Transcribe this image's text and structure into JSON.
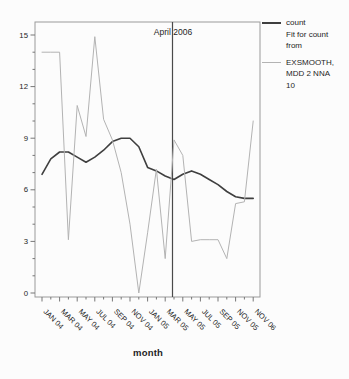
{
  "figure": {
    "xlabel": "month",
    "ref_line_label": "April 2006"
  },
  "legend": {
    "rows": [
      {
        "text": "count",
        "swatch": "#3f3f3f",
        "swatch_thickness": 2,
        "gap_before": false
      },
      {
        "text": "Fit for count",
        "swatch": null,
        "swatch_thickness": 0,
        "gap_before": false
      },
      {
        "text": "from",
        "swatch": null,
        "swatch_thickness": 0,
        "gap_before": false
      },
      {
        "text": "EXSMOOTH,",
        "swatch": "#b3b3b3",
        "swatch_thickness": 1,
        "gap_before": true
      },
      {
        "text": "MDD 2 NNA",
        "swatch": null,
        "swatch_thickness": 0,
        "gap_before": false
      },
      {
        "text": "10",
        "swatch": null,
        "swatch_thickness": 0,
        "gap_before": false
      }
    ]
  },
  "chart_data": {
    "type": "line",
    "title": "",
    "xlabel": "month",
    "ylabel": "",
    "grid": false,
    "legend_position": "right-outside",
    "ylim": [
      0,
      15
    ],
    "y_ticks": [
      0,
      3,
      6,
      9,
      12,
      15
    ],
    "x_tick_labels": [
      "JAN 04",
      "MAR 04",
      "MAY 04",
      "JUL 04",
      "SEP 04",
      "NOV 04",
      "JAN 05",
      "MAR 05",
      "MAY 05",
      "JUL 05",
      "SEP 05",
      "NOV 05",
      "NOV 06"
    ],
    "annotation": {
      "type": "vertical-reference-line",
      "label": "April 2006",
      "position": "between MAR 05 and MAY 05 ticks"
    },
    "x": [
      "Jan 04",
      "Feb 04",
      "Mar 04",
      "Apr 04",
      "May 04",
      "Jun 04",
      "Jul 04",
      "Aug 04",
      "Sep 04",
      "Oct 04",
      "Nov 04",
      "Dec 04",
      "Jan 05",
      "Feb 05",
      "Mar 05",
      "Apr 05",
      "May 05",
      "Jun 05",
      "Jul 05",
      "Aug 05",
      "Sep 05",
      "Oct 05",
      "Nov 05",
      "Dec 05",
      "Nov 06"
    ],
    "series": [
      {
        "name": "count",
        "color": "#3f3f3f",
        "width": 1.6,
        "values": [
          6.9,
          7.8,
          8.2,
          8.2,
          7.9,
          7.6,
          7.9,
          8.3,
          8.8,
          9.0,
          9.0,
          8.5,
          7.3,
          7.1,
          6.8,
          6.6,
          6.9,
          7.1,
          6.9,
          6.6,
          6.3,
          5.9,
          5.6,
          5.5,
          5.5
        ]
      },
      {
        "name": "Fit for count from EXSMOOTH, MDD 2 NNA 10",
        "color": "#b3b3b3",
        "width": 1,
        "values": [
          14.0,
          14.0,
          14.0,
          3.1,
          10.9,
          9.1,
          14.9,
          10.1,
          8.9,
          7.0,
          4.0,
          0.0,
          3.5,
          7.2,
          2.0,
          8.9,
          8.0,
          3.0,
          3.1,
          3.1,
          3.1,
          2.0,
          5.2,
          5.3,
          10.0
        ]
      }
    ]
  }
}
